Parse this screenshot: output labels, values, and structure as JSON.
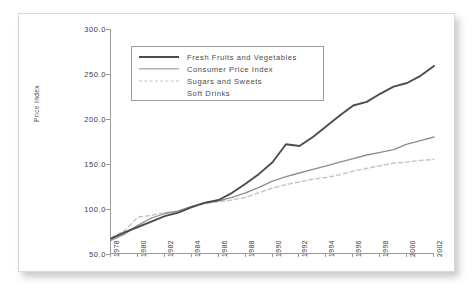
{
  "chart_data": {
    "type": "line",
    "title": "",
    "xlabel": "",
    "ylabel": "Price Index",
    "xlim": [
      1978,
      2002
    ],
    "ylim": [
      50.0,
      300.0
    ],
    "grid": false,
    "legend_position": "top-left",
    "x": [
      1978,
      1979,
      1980,
      1981,
      1982,
      1983,
      1984,
      1985,
      1986,
      1987,
      1988,
      1989,
      1990,
      1991,
      1992,
      1993,
      1994,
      1995,
      1996,
      1997,
      1998,
      1999,
      2000,
      2001,
      2002
    ],
    "series": [
      {
        "name": "Fresh Fruits and Vegetables",
        "style": "solid-thick",
        "color": "#4c4c4c",
        "values": [
          67,
          74,
          80,
          86,
          92,
          96,
          102,
          107,
          110,
          118,
          128,
          139,
          152,
          172,
          170,
          180,
          192,
          204,
          215,
          219,
          228,
          236,
          240,
          248,
          259
        ]
      },
      {
        "name": "Consumer Price Index",
        "style": "solid-thin",
        "color": "#8d8d8d",
        "values": [
          65,
          72,
          82,
          90,
          95,
          98,
          103,
          107,
          109,
          113,
          118,
          124,
          131,
          136,
          140,
          144,
          148,
          152,
          156,
          160,
          163,
          166,
          172,
          176,
          180
        ]
      },
      {
        "name": "Sugars and Sweets",
        "style": "dashed",
        "color": "#c2c2c2",
        "values": [
          68,
          76,
          91,
          93,
          96,
          97,
          102,
          106,
          108,
          110,
          113,
          118,
          123,
          127,
          130,
          133,
          135,
          138,
          142,
          145,
          148,
          151,
          152,
          154,
          155
        ]
      },
      {
        "name": "Soft Drinks",
        "style": "none",
        "color": "#eeeeee",
        "values": [
          66,
          73,
          83,
          90,
          94,
          97,
          102,
          106,
          108,
          110,
          114,
          119,
          124,
          128,
          131,
          134,
          137,
          140,
          143,
          146,
          149,
          151,
          153,
          154,
          156
        ]
      }
    ],
    "y_ticks": [
      "300.0",
      "250.0",
      "200.0",
      "150.0",
      "100.0",
      "50.0"
    ],
    "y_tick_values": [
      300.0,
      250.0,
      200.0,
      150.0,
      100.0,
      50.0
    ],
    "x_ticks": [
      "1978",
      "1980",
      "1982",
      "1984",
      "1986",
      "1988",
      "1990",
      "1992",
      "1994",
      "1996",
      "1998",
      "2000",
      "2002"
    ],
    "x_tick_values": [
      1978,
      1980,
      1982,
      1984,
      1986,
      1988,
      1990,
      1992,
      1994,
      1996,
      1998,
      2000,
      2002
    ]
  },
  "legend": {
    "items": [
      {
        "label": "Fresh Fruits and Vegetables",
        "swatch": "solid-thick"
      },
      {
        "label": "Consumer Price Index",
        "swatch": "solid-thin"
      },
      {
        "label": "Sugars and Sweets",
        "swatch": "dashed"
      },
      {
        "label": "Soft Drinks",
        "swatch": "none"
      }
    ]
  },
  "colors": {
    "fresh_fruits": "#4c4c4c",
    "cpi": "#8d8d8d",
    "sugars": "#c2c2c2",
    "soft_drinks": "#eeeeee",
    "axis": "#9b9b9b",
    "text": "#3a3a3a",
    "card_border": "#d8d8d8"
  }
}
